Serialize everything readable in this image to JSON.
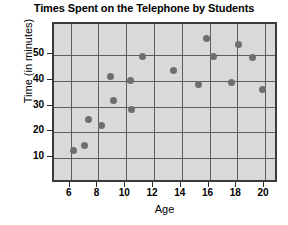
{
  "chart_data": {
    "type": "scatter",
    "title": "Times Spent on the Telephone by Students",
    "xlabel": "Age",
    "ylabel": "Time (in minutes)",
    "xlim": [
      4.8,
      21.0
    ],
    "ylim": [
      0,
      62
    ],
    "xticks": [
      6,
      8,
      10,
      12,
      14,
      16,
      18,
      20
    ],
    "yticks": [
      10,
      20,
      30,
      40,
      50
    ],
    "grid": true,
    "legend": null,
    "point_color": "#6e6e6e",
    "plot_background": "#d9d9d9",
    "points": [
      {
        "x": 6.2,
        "y": 13.0
      },
      {
        "x": 7.0,
        "y": 15.0
      },
      {
        "x": 7.3,
        "y": 25.0
      },
      {
        "x": 8.2,
        "y": 22.5
      },
      {
        "x": 8.9,
        "y": 41.5
      },
      {
        "x": 9.1,
        "y": 32.5
      },
      {
        "x": 10.3,
        "y": 40.0
      },
      {
        "x": 10.4,
        "y": 29.0
      },
      {
        "x": 11.2,
        "y": 49.5
      },
      {
        "x": 13.4,
        "y": 44.0
      },
      {
        "x": 15.2,
        "y": 38.5
      },
      {
        "x": 15.8,
        "y": 56.5
      },
      {
        "x": 16.3,
        "y": 49.5
      },
      {
        "x": 17.6,
        "y": 39.5
      },
      {
        "x": 18.1,
        "y": 54.0
      },
      {
        "x": 19.1,
        "y": 49.0
      },
      {
        "x": 19.8,
        "y": 36.5
      }
    ]
  }
}
